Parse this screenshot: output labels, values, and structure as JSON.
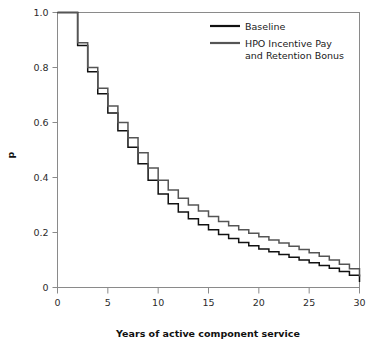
{
  "chart_data": {
    "type": "line",
    "subtype": "step-survival-curve",
    "title": "",
    "xlabel": "Years of active component service",
    "ylabel": "p",
    "xlim": [
      0,
      30
    ],
    "ylim": [
      0,
      1.0
    ],
    "xticks": [
      0,
      5,
      10,
      15,
      20,
      25,
      30
    ],
    "xtick_labels": [
      "0",
      "5",
      "10",
      "15",
      "20",
      "25",
      "30"
    ],
    "yticks": [
      0,
      0.2,
      0.4,
      0.6,
      0.8,
      1.0
    ],
    "ytick_labels": [
      "0",
      "0.2",
      "0.4",
      "0.6",
      "0.8",
      "1.0"
    ],
    "grid": false,
    "legend_position": "top-right",
    "x": [
      0,
      1,
      2,
      3,
      4,
      5,
      6,
      7,
      8,
      9,
      10,
      11,
      12,
      13,
      14,
      15,
      16,
      17,
      18,
      19,
      20,
      21,
      22,
      23,
      24,
      25,
      26,
      27,
      28,
      29,
      30
    ],
    "series": [
      {
        "name": "Baseline",
        "color": "#111111",
        "values": [
          1.0,
          1.0,
          0.88,
          0.785,
          0.705,
          0.635,
          0.57,
          0.51,
          0.45,
          0.39,
          0.34,
          0.305,
          0.275,
          0.25,
          0.228,
          0.21,
          0.193,
          0.178,
          0.164,
          0.152,
          0.14,
          0.13,
          0.12,
          0.11,
          0.1,
          0.09,
          0.08,
          0.07,
          0.058,
          0.045,
          0.02
        ]
      },
      {
        "name": "HPO Incentive Pay and Retention Bonus",
        "color": "#555555",
        "values": [
          1.0,
          1.0,
          0.89,
          0.8,
          0.725,
          0.66,
          0.6,
          0.545,
          0.49,
          0.435,
          0.39,
          0.355,
          0.325,
          0.3,
          0.278,
          0.258,
          0.24,
          0.225,
          0.21,
          0.197,
          0.185,
          0.173,
          0.162,
          0.15,
          0.138,
          0.126,
          0.114,
          0.1,
          0.085,
          0.068,
          0.04
        ]
      }
    ]
  },
  "legend": {
    "entries": [
      {
        "label": "Baseline",
        "color": "#111111"
      },
      {
        "label": "HPO Incentive Pay",
        "label2": "and Retention Bonus",
        "color": "#555555"
      }
    ]
  },
  "axes": {
    "x_title": "Years of active component service",
    "y_title": "p"
  },
  "colors": {
    "frame": "#8a8a8a",
    "tick": "#8a8a8a",
    "baseline": "#111111",
    "hpo": "#555555",
    "background": "#ffffff"
  }
}
